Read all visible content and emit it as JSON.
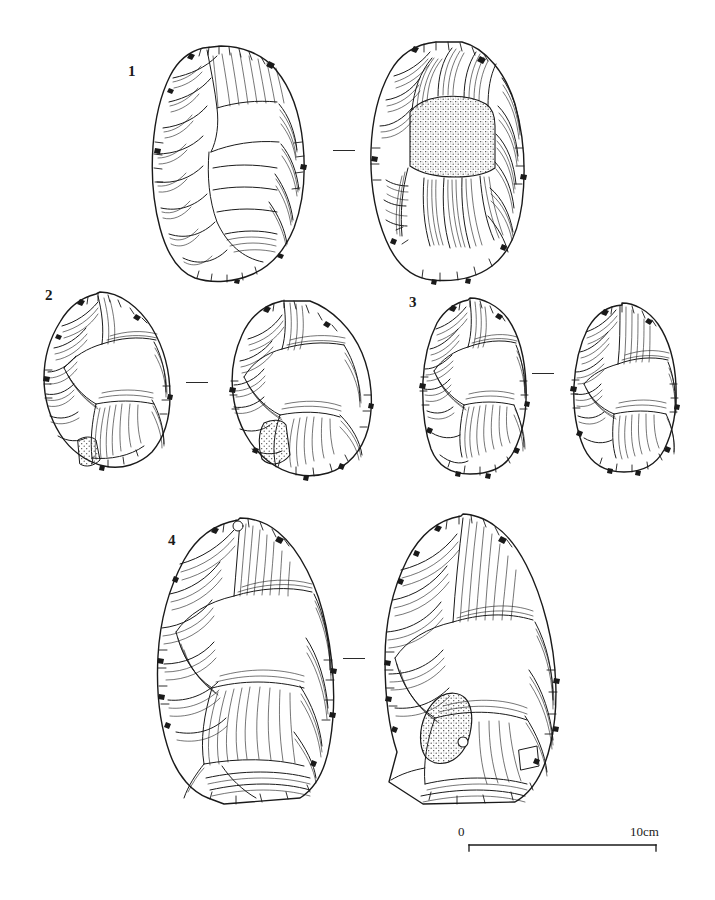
{
  "figure": {
    "kind": "archaeological-lithic-illustration",
    "background_color": "#ffffff",
    "ink_color": "#1a1a1a",
    "stipple_color": "#3a3a3a"
  },
  "scale_bar": {
    "start_label": "0",
    "end_label": "10cm",
    "length_px": 187,
    "x": 468,
    "y": 845
  },
  "artifacts": [
    {
      "number": "1",
      "label_x": 128,
      "label_y": 64,
      "separator": {
        "x": 333,
        "y": 150,
        "width": 22
      },
      "views": [
        {
          "side": "obverse",
          "x": 143,
          "y": 44,
          "width": 170,
          "height": 240,
          "cortex": false
        },
        {
          "side": "reverse",
          "x": 362,
          "y": 38,
          "width": 170,
          "height": 248,
          "cortex": true
        }
      ]
    },
    {
      "number": "2",
      "label_x": 45,
      "label_y": 288,
      "separator": {
        "x": 186,
        "y": 382,
        "width": 22
      },
      "views": [
        {
          "side": "obverse",
          "x": 38,
          "y": 290,
          "width": 140,
          "height": 190,
          "cortex": true
        },
        {
          "side": "reverse",
          "x": 228,
          "y": 295,
          "width": 150,
          "height": 190,
          "cortex": true
        }
      ]
    },
    {
      "number": "3",
      "label_x": 409,
      "label_y": 295,
      "separator": {
        "x": 532,
        "y": 373,
        "width": 22
      },
      "views": [
        {
          "side": "obverse",
          "x": 418,
          "y": 297,
          "width": 115,
          "height": 180,
          "cortex": false
        },
        {
          "side": "reverse",
          "x": 570,
          "y": 302,
          "width": 112,
          "height": 172,
          "cortex": false
        }
      ]
    },
    {
      "number": "4",
      "label_x": 168,
      "label_y": 533,
      "separator": {
        "x": 343,
        "y": 658,
        "width": 22
      },
      "views": [
        {
          "side": "obverse",
          "x": 150,
          "y": 516,
          "width": 190,
          "height": 290,
          "cortex": false
        },
        {
          "side": "reverse",
          "x": 375,
          "y": 512,
          "width": 190,
          "height": 300,
          "cortex": true
        }
      ]
    }
  ]
}
